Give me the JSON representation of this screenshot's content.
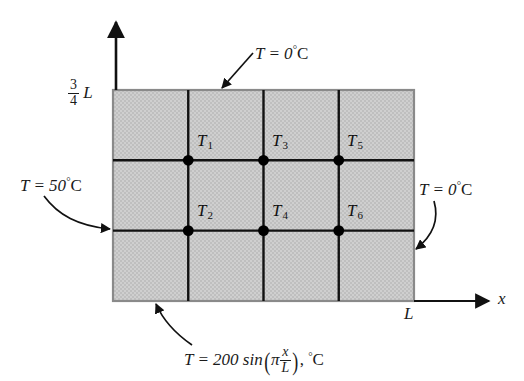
{
  "figure": {
    "fill_color": "#c9c9c9",
    "line_color": "#111111"
  },
  "axes": {
    "y_label_numerator": "3",
    "y_label_denominator": "4",
    "y_label_suffix": "L",
    "x_label": "x",
    "x_extent_label": "L"
  },
  "boundary_conditions": {
    "top": {
      "text_prefix": "T = 0",
      "degree": "°",
      "unit": "C"
    },
    "left": {
      "text_prefix": "T = 50",
      "degree": "°",
      "unit": "C"
    },
    "right": {
      "text_prefix": "T = 0",
      "degree": "°",
      "unit": "C"
    },
    "bottom": {
      "prefix": "T = 200 sin",
      "paren_open": "(",
      "pi": "π",
      "frac_numerator": "x",
      "frac_denominator": "L",
      "paren_close": ")",
      "suffix": ",",
      "degree": "°",
      "unit": "C"
    }
  },
  "nodes": [
    {
      "label": "T",
      "sub": "1"
    },
    {
      "label": "T",
      "sub": "2"
    },
    {
      "label": "T",
      "sub": "3"
    },
    {
      "label": "T",
      "sub": "4"
    },
    {
      "label": "T",
      "sub": "5"
    },
    {
      "label": "T",
      "sub": "6"
    }
  ]
}
